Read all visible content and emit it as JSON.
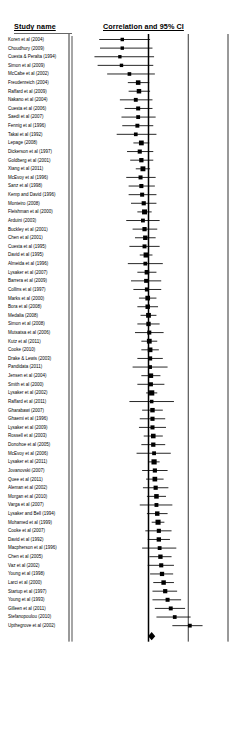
{
  "header": {
    "study_col": "Study name",
    "plot_col": "Correlation and 95% CI"
  },
  "axis": {
    "ticks": [
      "-1.00",
      "-0.50",
      "0.00",
      "0.50",
      "1.00"
    ],
    "tick_values": [
      -1.0,
      -0.5,
      0.0,
      0.5,
      1.0
    ]
  },
  "chart_data": {
    "type": "forest",
    "title": "Correlation and 95% CI",
    "xlabel": "",
    "ylabel": "",
    "xlim": [
      -1.0,
      1.0
    ],
    "grid": false,
    "legend": "none",
    "effect_measure": "Correlation",
    "ci_level": "95%",
    "reference_line": 0.0,
    "axis_ticks": [
      -1.0,
      -0.5,
      0.0,
      0.5,
      1.0
    ],
    "axis_tick_labels": [
      "-1.00",
      "-0.50",
      "0.00",
      "0.50",
      "1.00"
    ],
    "summary": {
      "label": "",
      "correlation": 0.04,
      "ci_lower": 0.01,
      "ci_upper": 0.07,
      "marker": "diamond"
    },
    "categories": [
      "Koren et al (2004)",
      "Choudhury (2009)",
      "Cuesta & Peralta (1994)",
      "Simon et al (2009)",
      "McCabe et al (2002)",
      "Freudenreich (2004)",
      "Raffard et al (2009)",
      "Nakano et al (2004)",
      "Cuesta et al (2006)",
      "Saedi et al (2007)",
      "Fennig et al (1996)",
      "Takai et al (1992)",
      "Lepage (2008)",
      "Dickerson et al (1997)",
      "Goldberg et al (2001)",
      "Xiang et al (2011)",
      "McEvoy et al (1996)",
      "Sanz et al (1998)",
      "Kemp and David (1996)",
      "Monteiro (2008)",
      "Fleishman et al (2000)",
      "Arduini (2003)",
      "Buckley et al (2001)",
      "Chen et al (2001)",
      "Cuesta et al (1995)",
      "David et al (1995)",
      "Almeida et al (1996)",
      "Lysaker et al (2007)",
      "Barrera et al (2009)",
      "Collins et al (1997)",
      "Marks et al (2000)",
      "Bora et al (2008)",
      "Medalia (2008)",
      "Simon et al (2008)",
      "Mutsatsa et al (2006)",
      "Kutz et al (2011)",
      "Cooke (2010)",
      "Drake & Lewis (2003)",
      "Pandidata (2011)",
      "Jensen et al (2004)",
      "Smith et al (2000)",
      "Lysaker et al (2002)",
      "Raffard et al (2011)",
      "Gharabawi (2007)",
      "Ghaemi et al (1996)",
      "Lysaker et al (2009)",
      "Rossell et al (2003)",
      "Donohoe et al (2005)",
      "McEvoy et al (2006)",
      "Lysaker et al (2011)",
      "Jovanovski (2007)",
      "Quee et al (2011)",
      "Aleman et al (2002)",
      "Morgan et al (2010)",
      "Varga et al (2007)",
      "Lysaker and Bell (1994)",
      "Mohamed et al (1999)",
      "Cooke et al (2007)",
      "David et al (1992)",
      "Macpherson et al (1996)",
      "Chen et al (2005)",
      "Vaz et al (2002)",
      "Young et al (1998)",
      "Larci et al (2000)",
      "Startup et al (1997)",
      "Young et al (1993)",
      "Gilleen et al (2011)",
      "Stefanopoulou (2010)",
      "Upthegrove et al (2002)"
    ],
    "studies": [
      {
        "label": "Koren et al (2004)",
        "correlation": -0.33,
        "ci_lower": -0.62,
        "ci_upper": 0.02,
        "weight": 1.2
      },
      {
        "label": "Choudhury (2009)",
        "correlation": -0.33,
        "ci_lower": -0.61,
        "ci_upper": 0.05,
        "weight": 1.1
      },
      {
        "label": "Cuesta & Peralta (1994)",
        "correlation": -0.36,
        "ci_lower": -0.68,
        "ci_upper": 0.07,
        "weight": 1.0
      },
      {
        "label": "Simon et al (2009)",
        "correlation": -0.34,
        "ci_lower": -0.64,
        "ci_upper": 0.06,
        "weight": 1.1
      },
      {
        "label": "McCabe et al (2002)",
        "correlation": -0.24,
        "ci_lower": -0.52,
        "ci_upper": 0.08,
        "weight": 1.5
      },
      {
        "label": "Freudenreich (2004)",
        "correlation": -0.13,
        "ci_lower": -0.26,
        "ci_upper": 0.01,
        "weight": 3.8
      },
      {
        "label": "Raffard et al (2009)",
        "correlation": -0.12,
        "ci_lower": -0.25,
        "ci_upper": 0.02,
        "weight": 3.6
      },
      {
        "label": "Nakano et al (2004)",
        "correlation": -0.16,
        "ci_lower": -0.36,
        "ci_upper": 0.05,
        "weight": 2.0
      },
      {
        "label": "Cuesta et al (2006)",
        "correlation": -0.13,
        "ci_lower": -0.3,
        "ci_upper": 0.05,
        "weight": 2.3
      },
      {
        "label": "Saedi et al (2007)",
        "correlation": -0.13,
        "ci_lower": -0.34,
        "ci_upper": 0.09,
        "weight": 1.9
      },
      {
        "label": "Fennig et al (1996)",
        "correlation": -0.14,
        "ci_lower": -0.33,
        "ci_upper": 0.06,
        "weight": 2.1
      },
      {
        "label": "Takai et al (1992)",
        "correlation": -0.16,
        "ci_lower": -0.4,
        "ci_upper": 0.1,
        "weight": 1.6
      },
      {
        "label": "Lepage (2008)",
        "correlation": -0.09,
        "ci_lower": -0.19,
        "ci_upper": 0.01,
        "weight": 4.6
      },
      {
        "label": "Dickerson et al (1997)",
        "correlation": -0.11,
        "ci_lower": -0.27,
        "ci_upper": 0.06,
        "weight": 2.6
      },
      {
        "label": "Goldberg et al (2001)",
        "correlation": -0.09,
        "ci_lower": -0.23,
        "ci_upper": 0.06,
        "weight": 3.1
      },
      {
        "label": "Xiang et al (2011)",
        "correlation": -0.07,
        "ci_lower": -0.16,
        "ci_upper": 0.02,
        "weight": 5.0
      },
      {
        "label": "McEvoy et al (1996)",
        "correlation": -0.1,
        "ci_lower": -0.28,
        "ci_upper": 0.09,
        "weight": 2.3
      },
      {
        "label": "Sanz et al (1998)",
        "correlation": -0.09,
        "ci_lower": -0.25,
        "ci_upper": 0.08,
        "weight": 2.6
      },
      {
        "label": "Kemp and David (1996)",
        "correlation": -0.08,
        "ci_lower": -0.25,
        "ci_upper": 0.1,
        "weight": 2.4
      },
      {
        "label": "Monteiro (2008)",
        "correlation": -0.06,
        "ci_lower": -0.22,
        "ci_upper": 0.1,
        "weight": 2.7
      },
      {
        "label": "Fleishman et al (2000)",
        "correlation": -0.05,
        "ci_lower": -0.14,
        "ci_upper": 0.04,
        "weight": 5.2
      },
      {
        "label": "Arduini (2003)",
        "correlation": -0.07,
        "ci_lower": -0.28,
        "ci_upper": 0.14,
        "weight": 1.9
      },
      {
        "label": "Buckley et al (2001)",
        "correlation": -0.05,
        "ci_lower": -0.2,
        "ci_upper": 0.11,
        "weight": 2.9
      },
      {
        "label": "Chen et al (2001)",
        "correlation": -0.04,
        "ci_lower": -0.17,
        "ci_upper": 0.09,
        "weight": 3.5
      },
      {
        "label": "Cuesta et al (1995)",
        "correlation": -0.05,
        "ci_lower": -0.24,
        "ci_upper": 0.14,
        "weight": 2.2
      },
      {
        "label": "David et al (1995)",
        "correlation": -0.03,
        "ci_lower": -0.11,
        "ci_upper": 0.05,
        "weight": 5.6
      },
      {
        "label": "Almeida et al (1996)",
        "correlation": -0.04,
        "ci_lower": -0.26,
        "ci_upper": 0.18,
        "weight": 1.8
      },
      {
        "label": "Lysaker et al (2007)",
        "correlation": -0.02,
        "ci_lower": -0.14,
        "ci_upper": 0.1,
        "weight": 3.8
      },
      {
        "label": "Barrera et al (2009)",
        "correlation": -0.03,
        "ci_lower": -0.22,
        "ci_upper": 0.16,
        "weight": 2.2
      },
      {
        "label": "Collins et al (1997)",
        "correlation": -0.02,
        "ci_lower": -0.19,
        "ci_upper": 0.16,
        "weight": 2.4
      },
      {
        "label": "Marks et al (2000)",
        "correlation": -0.01,
        "ci_lower": -0.12,
        "ci_upper": 0.1,
        "weight": 4.2
      },
      {
        "label": "Bora et al (2008)",
        "correlation": -0.01,
        "ci_lower": -0.14,
        "ci_upper": 0.12,
        "weight": 3.5
      },
      {
        "label": "Medalia (2008)",
        "correlation": 0.0,
        "ci_lower": -0.1,
        "ci_upper": 0.1,
        "weight": 4.6
      },
      {
        "label": "Simon et al (2008)",
        "correlation": 0.0,
        "ci_lower": -0.14,
        "ci_upper": 0.14,
        "weight": 3.3
      },
      {
        "label": "Mutsatsa et al (2006)",
        "correlation": 0.01,
        "ci_lower": -0.17,
        "ci_upper": 0.19,
        "weight": 2.4
      },
      {
        "label": "Kutz et al (2011)",
        "correlation": 0.01,
        "ci_lower": -0.09,
        "ci_upper": 0.11,
        "weight": 4.6
      },
      {
        "label": "Cooke (2010)",
        "correlation": 0.02,
        "ci_lower": -0.09,
        "ci_upper": 0.13,
        "weight": 4.2
      },
      {
        "label": "Drake & Lewis (2003)",
        "correlation": 0.02,
        "ci_lower": -0.14,
        "ci_upper": 0.18,
        "weight": 2.7
      },
      {
        "label": "Pandidata (2011)",
        "correlation": 0.02,
        "ci_lower": -0.2,
        "ci_upper": 0.24,
        "weight": 1.8
      },
      {
        "label": "Jensen et al (2004)",
        "correlation": 0.03,
        "ci_lower": -0.09,
        "ci_upper": 0.15,
        "weight": 3.8
      },
      {
        "label": "Smith et al (2000)",
        "correlation": 0.03,
        "ci_lower": -0.14,
        "ci_upper": 0.2,
        "weight": 2.5
      },
      {
        "label": "Lysaker et al (2002)",
        "correlation": 0.04,
        "ci_lower": -0.03,
        "ci_upper": 0.11,
        "weight": 6.2
      },
      {
        "label": "Raffard et al (2011)",
        "correlation": 0.04,
        "ci_lower": -0.24,
        "ci_upper": 0.32,
        "weight": 1.3
      },
      {
        "label": "Gharabawi (2007)",
        "correlation": 0.05,
        "ci_lower": -0.08,
        "ci_upper": 0.18,
        "weight": 3.5
      },
      {
        "label": "Ghaemi et al (1996)",
        "correlation": 0.05,
        "ci_lower": -0.11,
        "ci_upper": 0.21,
        "weight": 2.7
      },
      {
        "label": "Lysaker et al (2009)",
        "correlation": 0.05,
        "ci_lower": -0.12,
        "ci_upper": 0.22,
        "weight": 2.5
      },
      {
        "label": "Rossell et al (2003)",
        "correlation": 0.06,
        "ci_lower": -0.06,
        "ci_upper": 0.18,
        "weight": 3.9
      },
      {
        "label": "Donohoe et al (2005)",
        "correlation": 0.06,
        "ci_lower": -0.09,
        "ci_upper": 0.21,
        "weight": 3.0
      },
      {
        "label": "McEvoy et al (2006)",
        "correlation": 0.07,
        "ci_lower": -0.15,
        "ci_upper": 0.28,
        "weight": 1.9
      },
      {
        "label": "Lysaker et al (2011)",
        "correlation": 0.07,
        "ci_lower": 0.0,
        "ci_upper": 0.14,
        "weight": 6.0
      },
      {
        "label": "Jovanovski (2007)",
        "correlation": 0.08,
        "ci_lower": -0.08,
        "ci_upper": 0.24,
        "weight": 2.7
      },
      {
        "label": "Quee et al (2011)",
        "correlation": 0.08,
        "ci_lower": -0.03,
        "ci_upper": 0.19,
        "weight": 4.2
      },
      {
        "label": "Aleman et al (2002)",
        "correlation": 0.09,
        "ci_lower": -0.07,
        "ci_upper": 0.25,
        "weight": 2.7
      },
      {
        "label": "Morgan et al (2010)",
        "correlation": 0.1,
        "ci_lower": -0.02,
        "ci_upper": 0.22,
        "weight": 3.8
      },
      {
        "label": "Varga et al (2007)",
        "correlation": 0.1,
        "ci_lower": -0.11,
        "ci_upper": 0.3,
        "weight": 2.0
      },
      {
        "label": "Lysaker and Bell (1994)",
        "correlation": 0.11,
        "ci_lower": -0.02,
        "ci_upper": 0.24,
        "weight": 3.5
      },
      {
        "label": "Mohamed et al (1999)",
        "correlation": 0.12,
        "ci_lower": 0.04,
        "ci_upper": 0.2,
        "weight": 5.6
      },
      {
        "label": "Cooke et al (2007)",
        "correlation": 0.13,
        "ci_lower": -0.04,
        "ci_upper": 0.29,
        "weight": 2.6
      },
      {
        "label": "David et al (1992)",
        "correlation": 0.13,
        "ci_lower": -0.01,
        "ci_upper": 0.27,
        "weight": 3.2
      },
      {
        "label": "Macpherson et al (1996)",
        "correlation": 0.14,
        "ci_lower": -0.08,
        "ci_upper": 0.35,
        "weight": 1.9
      },
      {
        "label": "Chen et al (2005)",
        "correlation": 0.15,
        "ci_lower": 0.01,
        "ci_upper": 0.29,
        "weight": 3.2
      },
      {
        "label": "Vaz et al (2002)",
        "correlation": 0.16,
        "ci_lower": -0.01,
        "ci_upper": 0.32,
        "weight": 2.6
      },
      {
        "label": "Young et al (1998)",
        "correlation": 0.17,
        "ci_lower": 0.02,
        "ci_upper": 0.31,
        "weight": 3.0
      },
      {
        "label": "Larci et al (2000)",
        "correlation": 0.19,
        "ci_lower": 0.06,
        "ci_upper": 0.32,
        "weight": 3.5
      },
      {
        "label": "Startup et al (1997)",
        "correlation": 0.21,
        "ci_lower": 0.05,
        "ci_upper": 0.36,
        "weight": 2.8
      },
      {
        "label": "Young et al (1993)",
        "correlation": 0.24,
        "ci_lower": 0.05,
        "ci_upper": 0.41,
        "weight": 2.3
      },
      {
        "label": "Gilleen et al (2011)",
        "correlation": 0.28,
        "ci_lower": 0.08,
        "ci_upper": 0.46,
        "weight": 2.1
      },
      {
        "label": "Stefanopoulou (2010)",
        "correlation": 0.33,
        "ci_lower": 0.1,
        "ci_upper": 0.53,
        "weight": 1.7
      },
      {
        "label": "Upthegrove et al (2002)",
        "correlation": 0.52,
        "ci_lower": 0.3,
        "ci_upper": 0.68,
        "weight": 1.8
      }
    ]
  }
}
